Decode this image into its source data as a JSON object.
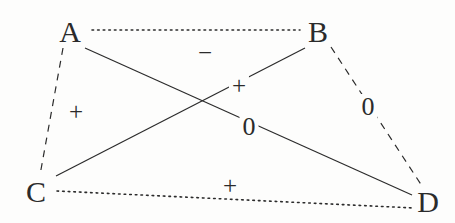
{
  "diagram": {
    "type": "signed-relation-graph",
    "background_color": "#fdfdfc",
    "stroke_color": "#2b2b2b",
    "width": 455,
    "height": 223,
    "nodes": [
      {
        "id": "A",
        "label": "A",
        "x": 70,
        "y": 32
      },
      {
        "id": "B",
        "label": "B",
        "x": 318,
        "y": 32
      },
      {
        "id": "C",
        "label": "C",
        "x": 36,
        "y": 192
      },
      {
        "id": "D",
        "label": "D",
        "x": 428,
        "y": 202
      }
    ],
    "edges": [
      {
        "id": "edge-a-b",
        "from": "A",
        "to": "B",
        "style": "dotted",
        "sign": "−",
        "sign_name": "minus",
        "x1": 92,
        "y1": 30,
        "x2": 300,
        "y2": 30,
        "label_x": 205,
        "label_y": 52
      },
      {
        "id": "edge-a-c",
        "from": "A",
        "to": "C",
        "style": "dashed",
        "sign": "+",
        "sign_name": "plus",
        "x1": 63,
        "y1": 48,
        "x2": 40,
        "y2": 175,
        "label_x": 76,
        "label_y": 111
      },
      {
        "id": "edge-a-d",
        "from": "A",
        "to": "D",
        "style": "solid",
        "sign": "0",
        "sign_name": "zero",
        "x1": 85,
        "y1": 48,
        "x2": 412,
        "y2": 195,
        "label_x": 249,
        "label_y": 127
      },
      {
        "id": "edge-b-c",
        "from": "B",
        "to": "C",
        "style": "solid",
        "sign": "+",
        "sign_name": "plus",
        "x1": 305,
        "y1": 48,
        "x2": 56,
        "y2": 176,
        "label_x": 239,
        "label_y": 85
      },
      {
        "id": "edge-b-d",
        "from": "B",
        "to": "D",
        "style": "dashed",
        "sign": "0",
        "sign_name": "zero",
        "x1": 331,
        "y1": 47,
        "x2": 422,
        "y2": 186,
        "label_x": 368,
        "label_y": 107
      },
      {
        "id": "edge-c-d",
        "from": "C",
        "to": "D",
        "style": "dotted",
        "sign": "+",
        "sign_name": "plus",
        "x1": 57,
        "y1": 191,
        "x2": 414,
        "y2": 208,
        "label_x": 230,
        "label_y": 185
      }
    ]
  }
}
